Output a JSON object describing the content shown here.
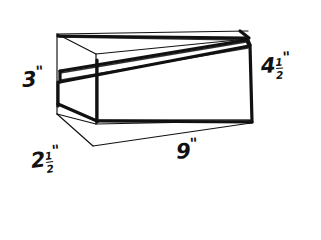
{
  "figure": {
    "ink_color": "#111111",
    "background_color": "#ffffff",
    "style": "hand-drawn pen sketch",
    "labels": [
      {
        "id": "height-left",
        "whole": "3",
        "numerator": "",
        "denominator": "",
        "unit": "\"",
        "meaning": "left end height"
      },
      {
        "id": "depth-front",
        "whole": "2",
        "numerator": "1",
        "denominator": "2",
        "unit": "\"",
        "meaning": "front depth"
      },
      {
        "id": "length-bottom",
        "whole": "9",
        "numerator": "",
        "denominator": "",
        "unit": "\"",
        "meaning": "bottom length"
      },
      {
        "id": "height-right",
        "whole": "4",
        "numerator": "1",
        "denominator": "2",
        "unit": "\"",
        "meaning": "right end height"
      }
    ]
  }
}
